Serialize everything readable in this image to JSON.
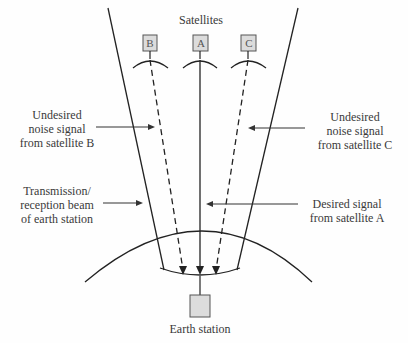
{
  "title": "Satellites",
  "satellites": [
    {
      "id": "B",
      "label": "B"
    },
    {
      "id": "A",
      "label": "A"
    },
    {
      "id": "C",
      "label": "C"
    }
  ],
  "labels": {
    "noise_b": [
      "Undesired",
      "noise signal",
      "from satellite B"
    ],
    "noise_c": [
      "Undesired",
      "noise signal",
      "from satellite C"
    ],
    "beam": [
      "Transmission/",
      "reception beam",
      "of earth station"
    ],
    "desired": [
      "Desired signal",
      "from satellite A"
    ],
    "earth_station": "Earth station"
  },
  "colors": {
    "line": "#222222",
    "box_fill": "#dcdcdc",
    "box_stroke": "#555555"
  }
}
